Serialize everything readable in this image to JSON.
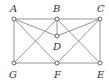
{
  "diagram": {
    "type": "geometry-figure",
    "points": [
      {
        "id": "A",
        "label": "A",
        "x": 14,
        "y": 19,
        "lx": 10,
        "ly": 12
      },
      {
        "id": "B",
        "label": "B",
        "x": 57,
        "y": 19,
        "lx": 53,
        "ly": 12
      },
      {
        "id": "C",
        "label": "C",
        "x": 100,
        "y": 19,
        "lx": 97,
        "ly": 12
      },
      {
        "id": "D",
        "label": "D",
        "x": 57,
        "y": 36,
        "lx": 53,
        "ly": 50
      },
      {
        "id": "G",
        "label": "G",
        "x": 14,
        "y": 63,
        "lx": 9,
        "ly": 78
      },
      {
        "id": "F",
        "label": "F",
        "x": 57,
        "y": 63,
        "lx": 54,
        "ly": 78
      },
      {
        "id": "E",
        "label": "E",
        "x": 100,
        "y": 63,
        "lx": 97,
        "ly": 78
      }
    ],
    "edges": [
      [
        "A",
        "C"
      ],
      [
        "C",
        "E"
      ],
      [
        "E",
        "G"
      ],
      [
        "G",
        "A"
      ],
      [
        "A",
        "D"
      ],
      [
        "C",
        "D"
      ],
      [
        "B",
        "D"
      ],
      [
        "A",
        "F"
      ],
      [
        "C",
        "F"
      ],
      [
        "B",
        "G"
      ],
      [
        "B",
        "E"
      ]
    ],
    "colors": {
      "edge": "#8a8a8a",
      "node_stroke": "#555555",
      "label": "#333333"
    }
  }
}
